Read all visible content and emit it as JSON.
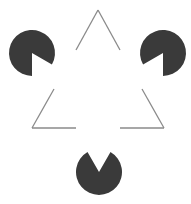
{
  "figure": {
    "width": 191,
    "height": 204,
    "background": "#ffffff",
    "disc_color": "#3a3a3a",
    "line_color": "#8a8a8a",
    "discs": [
      {
        "name": "top-left-disc",
        "cx": 32,
        "cy": 53,
        "r": 23,
        "notch_toward": "lower-right"
      },
      {
        "name": "top-right-disc",
        "cx": 163,
        "cy": 53,
        "r": 23,
        "notch_toward": "lower-left"
      },
      {
        "name": "bottom-disc",
        "cx": 99,
        "cy": 172,
        "r": 23,
        "notch_toward": "up"
      }
    ],
    "outline_triangle": {
      "vertices": [
        [
          98,
          10
        ],
        [
          32,
          128
        ],
        [
          164,
          128
        ]
      ],
      "segments": [
        {
          "name": "apex-left-segment",
          "x1": 98,
          "y1": 10,
          "x2": 76,
          "y2": 50
        },
        {
          "name": "apex-right-segment",
          "x1": 98,
          "y1": 10,
          "x2": 120,
          "y2": 50
        },
        {
          "name": "lower-left-side-segment",
          "x1": 32,
          "y1": 128,
          "x2": 54,
          "y2": 89
        },
        {
          "name": "bottom-left-segment",
          "x1": 32,
          "y1": 128,
          "x2": 76,
          "y2": 128
        },
        {
          "name": "lower-right-side-segment",
          "x1": 164,
          "y1": 128,
          "x2": 142,
          "y2": 89
        },
        {
          "name": "bottom-right-segment",
          "x1": 120,
          "y1": 128,
          "x2": 164,
          "y2": 128
        }
      ]
    }
  }
}
